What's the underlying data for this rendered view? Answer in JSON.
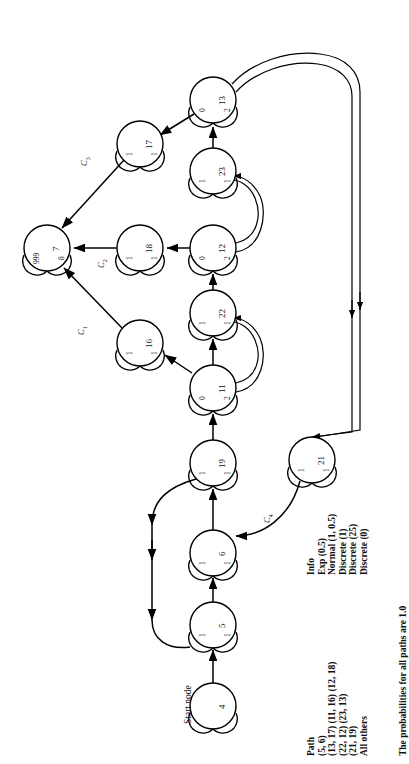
{
  "figure": {
    "type": "activity-network-diagram",
    "orientation": "rotated-90-ccw",
    "caption": "The probabilities for all paths are 1.0",
    "start_node_label": "Start node"
  },
  "nodes": [
    {
      "id": "4",
      "label": "4",
      "left_lobe": "",
      "right_lobe": "",
      "cx": 213,
      "cy": 706,
      "r": 23
    },
    {
      "id": "5",
      "label": "5",
      "left_lobe": "1",
      "right_lobe": "1",
      "cx": 213,
      "cy": 625,
      "r": 23
    },
    {
      "id": "6",
      "label": "6",
      "left_lobe": "1",
      "right_lobe": "1",
      "cx": 213,
      "cy": 553,
      "r": 23
    },
    {
      "id": "19",
      "label": "19",
      "left_lobe": "1",
      "right_lobe": "1",
      "cx": 213,
      "cy": 463,
      "r": 23
    },
    {
      "id": "21",
      "label": "21",
      "left_lobe": "1",
      "right_lobe": "1",
      "cx": 312,
      "cy": 460,
      "r": 23
    },
    {
      "id": "11",
      "label": "11",
      "left_lobe": "0",
      "right_lobe": "2",
      "cx": 213,
      "cy": 388,
      "r": 23
    },
    {
      "id": "16",
      "label": "16",
      "left_lobe": "1",
      "right_lobe": "1",
      "cx": 140,
      "cy": 343,
      "r": 23
    },
    {
      "id": "22",
      "label": "22",
      "left_lobe": "1",
      "right_lobe": "1",
      "cx": 213,
      "cy": 313,
      "r": 23
    },
    {
      "id": "7",
      "label": "7",
      "left_lobe": "999",
      "right_lobe": "8",
      "cx": 47,
      "cy": 248,
      "r": 23
    },
    {
      "id": "18",
      "label": "18",
      "left_lobe": "1",
      "right_lobe": "1",
      "cx": 140,
      "cy": 248,
      "r": 23
    },
    {
      "id": "12",
      "label": "12",
      "left_lobe": "0",
      "right_lobe": "2",
      "cx": 213,
      "cy": 248,
      "r": 23
    },
    {
      "id": "23",
      "label": "23",
      "left_lobe": "1",
      "right_lobe": "1",
      "cx": 213,
      "cy": 171,
      "r": 23
    },
    {
      "id": "17",
      "label": "17",
      "left_lobe": "1",
      "right_lobe": "1",
      "cx": 140,
      "cy": 144,
      "r": 23
    },
    {
      "id": "13",
      "label": "13",
      "left_lobe": "0",
      "right_lobe": "2",
      "cx": 213,
      "cy": 100,
      "r": 23
    }
  ],
  "edge_labels": [
    {
      "name": "c1",
      "base": "C",
      "sub": "1",
      "x": 76,
      "y": 335
    },
    {
      "name": "c2",
      "base": "C",
      "sub": "2",
      "x": 96,
      "y": 268
    },
    {
      "name": "c3",
      "base": "C",
      "sub": "3",
      "x": 79,
      "y": 166
    },
    {
      "name": "c4",
      "base": "C",
      "sub": "4",
      "x": 262,
      "y": 523
    }
  ],
  "path_table": {
    "header_path": "Path",
    "header_info": "Info",
    "rows": [
      {
        "path": "(5, 6)",
        "info": "Exp (0.5)"
      },
      {
        "path": "(13, 17) (11, 16) (12, 18)",
        "info": "Normal (1, 0.5)"
      },
      {
        "path": "(22, 12) (23, 13)",
        "info": "Discrete (1)"
      },
      {
        "path": "(21, 19)",
        "info": "Discrete (25)"
      },
      {
        "path": "All others",
        "info": "Discrete (0)"
      }
    ]
  },
  "colors": {
    "stroke": "#000000",
    "background": "#ffffff",
    "text": "#111111"
  }
}
